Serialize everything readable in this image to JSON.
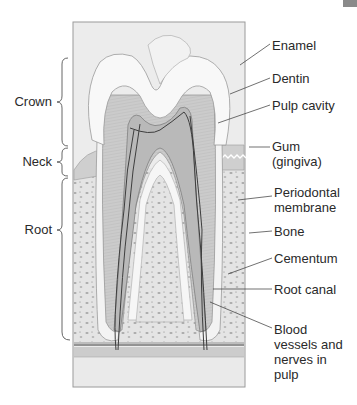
{
  "figure": {
    "region_labels": [
      {
        "id": "crown",
        "text": "Crown"
      },
      {
        "id": "neck",
        "text": "Neck"
      },
      {
        "id": "root",
        "text": "Root"
      }
    ],
    "structure_labels": [
      {
        "id": "enamel",
        "lines": [
          "Enamel"
        ]
      },
      {
        "id": "dentin",
        "lines": [
          "Dentin"
        ]
      },
      {
        "id": "pulp-cavity",
        "lines": [
          "Pulp cavity"
        ]
      },
      {
        "id": "gum",
        "lines": [
          "Gum",
          "(gingiva)"
        ]
      },
      {
        "id": "periodontal-membrane",
        "lines": [
          "Periodontal",
          "membrane"
        ]
      },
      {
        "id": "bone",
        "lines": [
          "Bone"
        ]
      },
      {
        "id": "cementum",
        "lines": [
          "Cementum"
        ]
      },
      {
        "id": "root-canal",
        "lines": [
          "Root canal"
        ]
      },
      {
        "id": "blood-vessels",
        "lines": [
          "Blood",
          "vessels and",
          "nerves in",
          "pulp"
        ]
      }
    ],
    "colors": {
      "frame_bg": "#ebebeb",
      "frame_border": "#9a9a9a",
      "enamel": "#f7f7f7",
      "dentin": "#c9c9c9",
      "pulp": "#b3b3b3",
      "bone": "#e2e2e2",
      "gum": "#cfcfcf",
      "vessel": "#404040",
      "text": "#2a2a2a"
    }
  }
}
